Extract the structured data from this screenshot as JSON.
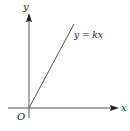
{
  "diagram": {
    "type": "coordinate-axes-line",
    "axes": {
      "x_label": "x",
      "y_label": "y",
      "origin_label": "O"
    },
    "line": {
      "equation_label": "y = kx",
      "passes_through_origin": true,
      "slope_sign": "positive"
    },
    "colors": {
      "axis": "#555555",
      "line": "#555555",
      "text": "#222222",
      "background": "#ffffff"
    }
  }
}
